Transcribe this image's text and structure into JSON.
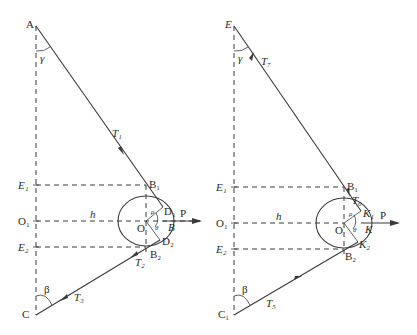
{
  "figure": {
    "left_diagram": {
      "points": {
        "A": "A",
        "E1": "E₁",
        "O1": "O₁",
        "E2": "E₂",
        "C": "C",
        "B1": "B₁",
        "B2": "B₂",
        "D1": "D₁",
        "D2": "D₂",
        "O": "O",
        "B": "B"
      },
      "forces": {
        "T1": "T₁",
        "T2": "T₂",
        "T3": "T₃",
        "P": "P"
      },
      "angles": {
        "gamma": "γ",
        "beta": "β",
        "theta": "θ",
        "rho": "ρ"
      },
      "dimension": {
        "h": "h"
      }
    },
    "right_diagram": {
      "points": {
        "E": "E",
        "E1": "E₁",
        "O1": "O₁",
        "E2": "E₂",
        "C": "C₁",
        "B1": "B₁",
        "B2": "B₂",
        "K1": "K₁",
        "K2": "K₂",
        "O": "O",
        "K": "K"
      },
      "forces": {
        "T7": "T₇",
        "T6": "T₆",
        "T5": "T₅",
        "P": "P"
      },
      "angles": {
        "gamma": "γ",
        "beta": "β",
        "theta": "θ",
        "rho": "ρ"
      },
      "dimension": {
        "h": "h"
      }
    }
  }
}
